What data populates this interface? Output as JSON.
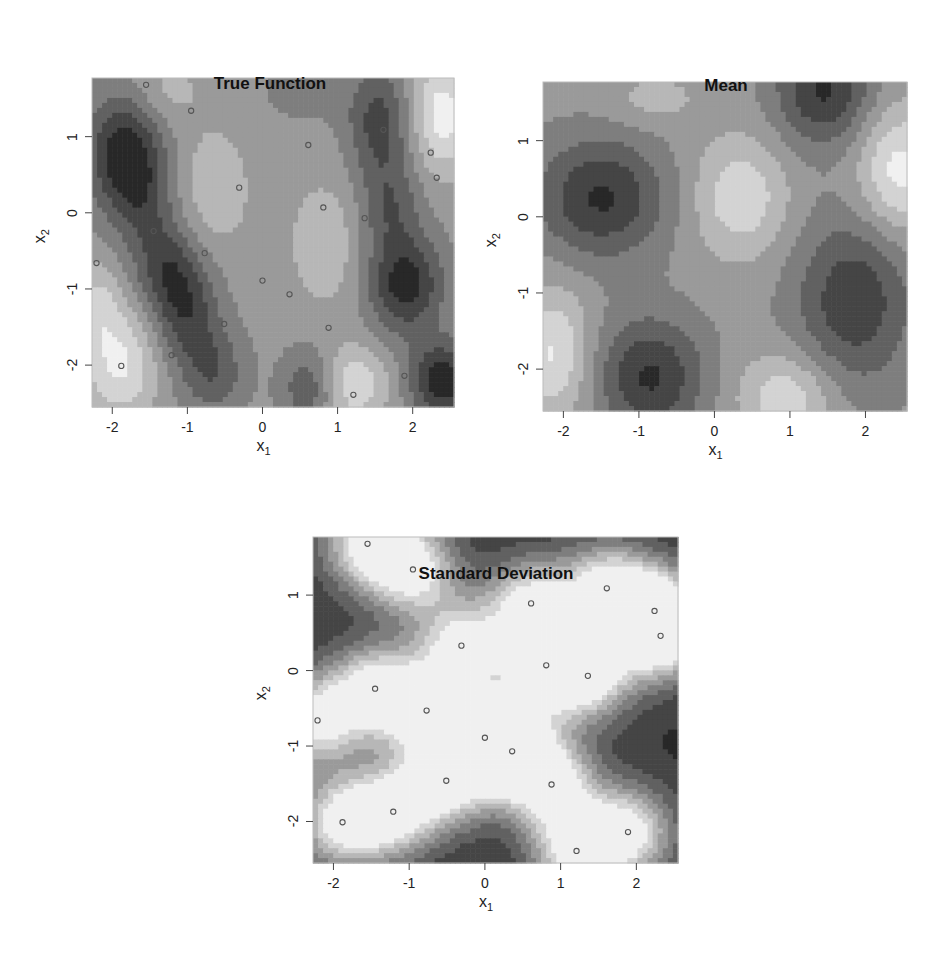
{
  "chart_data": [
    {
      "id": "true",
      "type": "heatmap",
      "title": "True Function",
      "xlabel": "x",
      "xlabel_sub": "1",
      "ylabel": "x",
      "ylabel_sub": "2",
      "xlim": [
        -2.27,
        2.55
      ],
      "ylim": [
        -2.55,
        1.77
      ],
      "xticks": [
        -2,
        -1,
        0,
        1,
        2
      ],
      "yticks": [
        -2,
        -1,
        0,
        1
      ],
      "colormap": "grayscale (dark = low, light = high)",
      "levels": 8,
      "base": 0.55,
      "bumps": [
        {
          "x": -1.85,
          "y": 0.8,
          "a": -0.55,
          "sx": 0.35,
          "sy": 0.55
        },
        {
          "x": -1.6,
          "y": 0.2,
          "a": -0.25,
          "sx": 0.3,
          "sy": 0.5
        },
        {
          "x": -1.3,
          "y": -0.7,
          "a": -0.35,
          "sx": 0.3,
          "sy": 0.45
        },
        {
          "x": -1.0,
          "y": -1.3,
          "a": -0.4,
          "sx": 0.3,
          "sy": 0.5
        },
        {
          "x": -0.65,
          "y": -2.1,
          "a": -0.3,
          "sx": 0.3,
          "sy": 0.4
        },
        {
          "x": 1.55,
          "y": 1.2,
          "a": -0.4,
          "sx": 0.3,
          "sy": 0.5
        },
        {
          "x": 1.7,
          "y": 0.1,
          "a": -0.3,
          "sx": 0.3,
          "sy": 0.45
        },
        {
          "x": 1.9,
          "y": -0.95,
          "a": -0.55,
          "sx": 0.35,
          "sy": 0.45
        },
        {
          "x": 2.4,
          "y": -2.2,
          "a": -0.6,
          "sx": 0.3,
          "sy": 0.35
        },
        {
          "x": 0.6,
          "y": -2.3,
          "a": -0.3,
          "sx": 0.25,
          "sy": 0.35
        },
        {
          "x": 0.55,
          "y": 1.6,
          "a": -0.15,
          "sx": 0.35,
          "sy": 0.25
        },
        {
          "x": -1.9,
          "y": -2.0,
          "a": 0.4,
          "sx": 0.35,
          "sy": 0.5
        },
        {
          "x": -2.2,
          "y": -1.2,
          "a": 0.25,
          "sx": 0.25,
          "sy": 0.4
        },
        {
          "x": -0.65,
          "y": 0.3,
          "a": 0.2,
          "sx": 0.35,
          "sy": 0.6
        },
        {
          "x": 0.85,
          "y": -0.4,
          "a": 0.2,
          "sx": 0.35,
          "sy": 0.6
        },
        {
          "x": 1.25,
          "y": -2.25,
          "a": 0.35,
          "sx": 0.3,
          "sy": 0.35
        },
        {
          "x": 2.4,
          "y": 1.3,
          "a": 0.45,
          "sx": 0.3,
          "sy": 0.55
        },
        {
          "x": -1.3,
          "y": 1.6,
          "a": 0.15,
          "sx": 0.35,
          "sy": 0.3
        }
      ],
      "points": "shared",
      "show_points": true
    },
    {
      "id": "mean",
      "type": "heatmap",
      "title": "Mean",
      "xlabel": "x",
      "xlabel_sub": "1",
      "ylabel": "x",
      "ylabel_sub": "2",
      "xlim": [
        -2.27,
        2.55
      ],
      "ylim": [
        -2.55,
        1.77
      ],
      "xticks": [
        -2,
        -1,
        0,
        1,
        2
      ],
      "yticks": [
        -2,
        -1,
        0,
        1
      ],
      "colormap": "grayscale (dark = low, light = high)",
      "levels": 8,
      "base": 0.55,
      "bumps": [
        {
          "x": -1.5,
          "y": 0.25,
          "a": -0.5,
          "sx": 0.6,
          "sy": 0.55
        },
        {
          "x": -0.85,
          "y": -2.1,
          "a": -0.5,
          "sx": 0.5,
          "sy": 0.55
        },
        {
          "x": 1.45,
          "y": 1.65,
          "a": -0.5,
          "sx": 0.45,
          "sy": 0.5
        },
        {
          "x": 1.85,
          "y": -1.1,
          "a": -0.45,
          "sx": 0.55,
          "sy": 0.8
        },
        {
          "x": 0.35,
          "y": 0.25,
          "a": 0.35,
          "sx": 0.45,
          "sy": 0.55
        },
        {
          "x": 0.95,
          "y": -2.35,
          "a": 0.35,
          "sx": 0.45,
          "sy": 0.4
        },
        {
          "x": 2.45,
          "y": 0.6,
          "a": 0.45,
          "sx": 0.4,
          "sy": 0.6
        },
        {
          "x": -2.15,
          "y": -1.8,
          "a": 0.4,
          "sx": 0.35,
          "sy": 0.6
        },
        {
          "x": -0.8,
          "y": 1.55,
          "a": 0.15,
          "sx": 0.45,
          "sy": 0.25
        }
      ],
      "show_points": false
    },
    {
      "id": "sd",
      "type": "heatmap",
      "title": "Standard Deviation",
      "xlabel": "x",
      "xlabel_sub": "1",
      "ylabel": "x",
      "ylabel_sub": "2",
      "xlim": [
        -2.27,
        2.55
      ],
      "ylim": [
        -2.55,
        1.77
      ],
      "xticks": [
        -2,
        -1,
        0,
        1,
        2
      ],
      "yticks": [
        -2,
        -1,
        0,
        1
      ],
      "colormap": "grayscale (dark = high SD, light = low SD near observations)",
      "levels": 8,
      "mode": "distance-to-points",
      "sigma": 0.42,
      "show_points": true
    }
  ],
  "points": [
    [
      -1.55,
      1.68
    ],
    [
      -0.95,
      1.34
    ],
    [
      0.61,
      0.89
    ],
    [
      1.61,
      1.09
    ],
    [
      2.24,
      0.79
    ],
    [
      2.32,
      0.46
    ],
    [
      -0.31,
      0.33
    ],
    [
      0.81,
      0.07
    ],
    [
      1.36,
      -0.07
    ],
    [
      -1.45,
      -0.24
    ],
    [
      -0.77,
      -0.53
    ],
    [
      -2.21,
      -0.66
    ],
    [
      0.0,
      -0.89
    ],
    [
      0.36,
      -1.07
    ],
    [
      -0.51,
      -1.46
    ],
    [
      0.88,
      -1.51
    ],
    [
      -1.21,
      -1.87
    ],
    [
      -1.88,
      -2.01
    ],
    [
      1.89,
      -2.14
    ],
    [
      1.21,
      -2.39
    ]
  ],
  "layout": {
    "true": {
      "box": [
        92,
        78,
        362,
        329
      ],
      "title_x": 270,
      "title_y": 12
    },
    "mean": {
      "box": [
        543,
        82,
        364,
        329
      ],
      "title_x": 726,
      "title_y": 14
    },
    "sd": {
      "box": [
        313,
        537,
        365,
        326
      ],
      "title_x": 496,
      "title_y": 502
    }
  }
}
